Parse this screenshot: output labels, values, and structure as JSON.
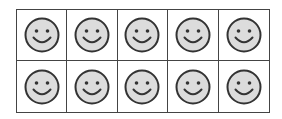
{
  "figure": {
    "rows": 2,
    "columns": 5,
    "colors": {
      "grid_line": "#444444",
      "face_fill": "#dcdcdc",
      "face_outline": "#333333",
      "background": "#ffffff"
    },
    "cells": [
      {
        "icon": "smiley-face-icon",
        "filled": true
      },
      {
        "icon": "smiley-face-icon",
        "filled": true
      },
      {
        "icon": "smiley-face-icon",
        "filled": true
      },
      {
        "icon": "smiley-face-icon",
        "filled": true
      },
      {
        "icon": "smiley-face-icon",
        "filled": true
      },
      {
        "icon": "smiley-face-icon",
        "filled": true
      },
      {
        "icon": "smiley-face-icon",
        "filled": true
      },
      {
        "icon": "smiley-face-icon",
        "filled": true
      },
      {
        "icon": "smiley-face-icon",
        "filled": true
      },
      {
        "icon": "smiley-face-icon",
        "filled": true
      }
    ],
    "count": 10
  }
}
